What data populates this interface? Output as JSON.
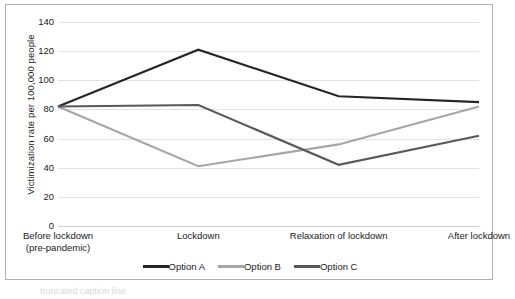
{
  "chart_data": {
    "type": "line",
    "title": "",
    "xlabel": "",
    "ylabel": "Victimization rate per 100,000 people",
    "categories": [
      "Before lockdown\n(pre-pandemic)",
      "Lockdown",
      "Relaxation of lockdown",
      "After lockdown"
    ],
    "category_lines": [
      [
        "Before lockdown",
        "(pre-pandemic)"
      ],
      [
        "Lockdown",
        ""
      ],
      [
        "Relaxation of lockdown",
        ""
      ],
      [
        "After lockdown",
        ""
      ]
    ],
    "series": [
      {
        "name": "Option A",
        "values": [
          82,
          121,
          89,
          85
        ],
        "color": "#262626"
      },
      {
        "name": "Option B",
        "values": [
          82,
          41,
          56,
          82
        ],
        "color": "#a6a6a6"
      },
      {
        "name": "Option C",
        "values": [
          82,
          83,
          42,
          62
        ],
        "color": "#595959"
      }
    ],
    "ylim": [
      0,
      140
    ],
    "ytick_values": [
      0,
      20,
      40,
      60,
      80,
      100,
      120,
      140
    ],
    "ytick_labels": [
      "0",
      "20",
      "40",
      "60",
      "80",
      "100",
      "120",
      "140"
    ],
    "grid": true,
    "grid_color": "#e2e2e2",
    "legend_position": "bottom-center"
  },
  "caption": {
    "text": "truncated caption line"
  }
}
